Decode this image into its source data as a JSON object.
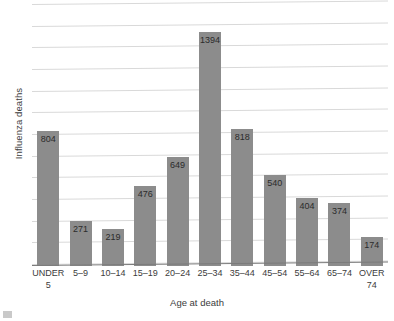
{
  "chart_data": {
    "type": "bar",
    "title": "",
    "xlabel": "Age at death",
    "ylabel": "Influenza deaths",
    "categories": [
      "UNDER 5",
      "5–9",
      "10–14",
      "15–19",
      "20–24",
      "25–34",
      "35–44",
      "45–54",
      "55–64",
      "65–74",
      "OVER 74"
    ],
    "category_lines": [
      [
        "UNDER",
        "5"
      ],
      [
        "5–9"
      ],
      [
        "10–14"
      ],
      [
        "15–19"
      ],
      [
        "20–24"
      ],
      [
        "25–34"
      ],
      [
        "35–44"
      ],
      [
        "45–54"
      ],
      [
        "55–64"
      ],
      [
        "65–74"
      ],
      [
        "OVER",
        "74"
      ]
    ],
    "values": [
      804,
      271,
      219,
      476,
      649,
      1394,
      818,
      540,
      404,
      374,
      174
    ],
    "value_labels": [
      "804",
      "271",
      "219",
      "476",
      "649",
      "1394",
      "818",
      "540",
      "404",
      "374",
      "174"
    ],
    "ylim": [
      0,
      1560
    ],
    "ytick_labels": [],
    "gridlines": true,
    "gridline_count": 13,
    "legend": false,
    "legend_position": "none",
    "bar_color": "#8c8c8c",
    "gridline_color": "#d9d9d9",
    "axis_color": "#7b7b7b",
    "text_color": "#3c3c3c",
    "background_color": "#ffffff",
    "data_labels_inside_bar_top": true
  }
}
